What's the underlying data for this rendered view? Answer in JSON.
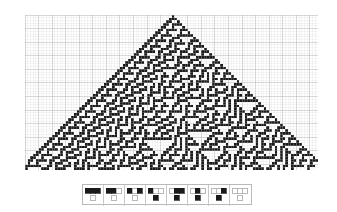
{
  "figure": {
    "background_color": "#ffffff",
    "cell_on_color": "#1a1a1a",
    "cell_off_color": "#ffffff",
    "grid_minor_color": "#d6d6d6",
    "grid_major_color": "#a8a8a8",
    "legend_border_color": "#b9b9b9"
  },
  "chart_data": {
    "type": "heatmap",
    "subtitle": "",
    "xlabel": "",
    "ylabel": "",
    "grid": true,
    "legend_position": "bottom",
    "automaton": {
      "rule_number": 30,
      "rule_binary": "00011110",
      "states": 2,
      "neighborhood": 3,
      "columns": 108,
      "rows": 57,
      "initial_condition": "single black cell at center",
      "initial_cell_column": 54,
      "grid_major_every": 5,
      "cell_size_px": 2.71
    },
    "rule_table": [
      {
        "index": 0,
        "neighborhood": "111",
        "neighborhood_cells": [
          1,
          1,
          1
        ],
        "output": 0
      },
      {
        "index": 1,
        "neighborhood": "110",
        "neighborhood_cells": [
          1,
          1,
          0
        ],
        "output": 0
      },
      {
        "index": 2,
        "neighborhood": "101",
        "neighborhood_cells": [
          1,
          0,
          1
        ],
        "output": 0
      },
      {
        "index": 3,
        "neighborhood": "100",
        "neighborhood_cells": [
          1,
          0,
          0
        ],
        "output": 1
      },
      {
        "index": 4,
        "neighborhood": "011",
        "neighborhood_cells": [
          0,
          1,
          1
        ],
        "output": 1
      },
      {
        "index": 5,
        "neighborhood": "010",
        "neighborhood_cells": [
          0,
          1,
          0
        ],
        "output": 1
      },
      {
        "index": 6,
        "neighborhood": "001",
        "neighborhood_cells": [
          0,
          0,
          1
        ],
        "output": 1
      },
      {
        "index": 7,
        "neighborhood": "000",
        "neighborhood_cells": [
          0,
          0,
          0
        ],
        "output": 0
      }
    ],
    "axis_ranges": {
      "x": [
        0,
        108
      ],
      "y": [
        0,
        57
      ]
    }
  }
}
